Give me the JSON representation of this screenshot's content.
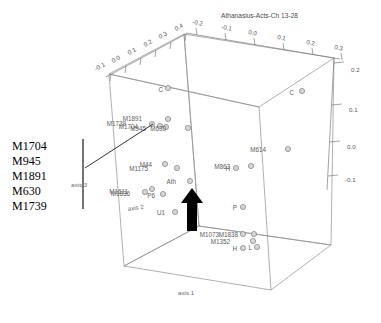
{
  "chart_data": {
    "type": "scatter",
    "title": "Athanasius-Acts-Ch 13-28",
    "projection": "3d-cube",
    "xlabel": "axis 1",
    "ylabel": "axis 2",
    "zlabel": "axis 3",
    "grid": false,
    "legend": "none",
    "axes": [
      {
        "name": "axis 3",
        "label": "axis 3",
        "position": "top-left-edge",
        "ticks": [
          "-0.1",
          "0.0",
          "0.1",
          "0.2",
          "0.3",
          "0.4"
        ]
      },
      {
        "name": "axis 2",
        "label": "axis 2",
        "position": "top-right-edge",
        "ticks": [
          "-0.2",
          "-0.1",
          "0.0",
          "0.1",
          "0.2",
          "0.3"
        ]
      },
      {
        "name": "axis 1",
        "label": "axis 1",
        "position": "right-vertical-edge",
        "ticks": [
          "0.2",
          "0.1",
          "0.0",
          "-0.1"
        ]
      }
    ],
    "points": [
      {
        "label": "C",
        "x": 168,
        "y": 88,
        "lx": 163,
        "ly": 90
      },
      {
        "label": "C",
        "x": 302,
        "y": 91,
        "lx": 294,
        "ly": 93
      },
      {
        "label": "M1891",
        "x": 168,
        "y": 119,
        "lx": 142,
        "ly": 119
      },
      {
        "label": "M1739",
        "x": 152,
        "y": 124,
        "lx": 126,
        "ly": 124
      },
      {
        "label": "M1704",
        "x": 160,
        "y": 126,
        "lx": 138,
        "ly": 127
      },
      {
        "label": "M945",
        "x": 166,
        "y": 127,
        "lx": 146,
        "ly": 129
      },
      {
        "label": "M630",
        "x": 188,
        "y": 128,
        "lx": 166,
        "ly": 129
      },
      {
        "label": "M614",
        "x": 288,
        "y": 149,
        "lx": 266,
        "ly": 150
      },
      {
        "label": "M44",
        "x": 165,
        "y": 164,
        "lx": 152,
        "ly": 165
      },
      {
        "label": "M1175",
        "x": 177,
        "y": 168,
        "lx": 148,
        "ly": 169
      },
      {
        "label": "M863",
        "x": 251,
        "y": 166,
        "lx": 230,
        "ly": 167
      },
      {
        "label": "H",
        "x": 236,
        "y": 168,
        "lx": 230,
        "ly": 169
      },
      {
        "label": "M1611",
        "x": 152,
        "y": 189,
        "lx": 128,
        "ly": 192
      },
      {
        "label": "M1836",
        "x": 145,
        "y": 192,
        "lx": 130,
        "ly": 194
      },
      {
        "label": "P6",
        "x": 163,
        "y": 194,
        "lx": 155,
        "ly": 196
      },
      {
        "label": "Ath",
        "x": 190,
        "y": 181,
        "lx": 176,
        "ly": 182
      },
      {
        "label": "P",
        "x": 243,
        "y": 207,
        "lx": 237,
        "ly": 208
      },
      {
        "label": "U1",
        "x": 175,
        "y": 212,
        "lx": 165,
        "ly": 213
      },
      {
        "label": "M1073",
        "x": 243,
        "y": 234,
        "lx": 219,
        "ly": 235
      },
      {
        "label": "M1838",
        "x": 254,
        "y": 234,
        "lx": 238,
        "ly": 235
      },
      {
        "label": "M1352",
        "x": 253,
        "y": 241,
        "lx": 230,
        "ly": 242
      },
      {
        "label": "H",
        "x": 243,
        "y": 248,
        "lx": 237,
        "ly": 249
      },
      {
        "label": "L",
        "x": 257,
        "y": 247,
        "lx": 252,
        "ly": 248
      }
    ],
    "annotations": [
      {
        "type": "callout",
        "name": "cluster-callout",
        "labels": [
          "M1704",
          "M945",
          "M1891",
          "M630",
          "M1739"
        ]
      },
      {
        "type": "arrow",
        "name": "highlight-arrow",
        "points_at": "Ath",
        "direction": "up"
      }
    ]
  },
  "callout": {
    "lines": [
      "M1704",
      "M945",
      "M1891",
      "M630",
      "M1739"
    ]
  },
  "title": "Athanasius-Acts-Ch 13-28",
  "axis_labels": {
    "axis1": "axis 1",
    "axis2": "axis 2",
    "axis3": "axis 3"
  },
  "ticks": {
    "axis3": [
      "-0.1",
      "0.0",
      "0.1",
      "0.2",
      "0.3",
      "0.4"
    ],
    "axis2": [
      "-0.2",
      "-0.1",
      "0.0",
      "0.1",
      "0.2",
      "0.3"
    ],
    "axis1": [
      "0.2",
      "0.1",
      "0.0",
      "-0.1"
    ]
  }
}
